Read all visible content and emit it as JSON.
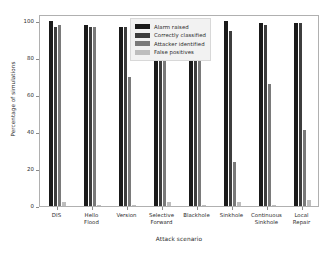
{
  "chart_data": {
    "type": "bar",
    "title": "",
    "xlabel": "Attack scenario",
    "ylabel": "Percentage of simulations",
    "ylim": [
      0,
      104
    ],
    "yticks": [
      0,
      20,
      40,
      60,
      80,
      100
    ],
    "ytick_labels": [
      "0",
      "20",
      "40",
      "60",
      "80",
      "100"
    ],
    "grid": false,
    "legend_position": "upper center",
    "categories": [
      "DIS",
      "Hello\nFlood",
      "Version",
      "Selective\nForward",
      "Blackhole",
      "Sinkhole",
      "Continuous\nSinkhole",
      "Local\nRepair"
    ],
    "series": [
      {
        "name": "Alarm raised",
        "color": "#1a1a1a",
        "values": [
          100,
          98,
          97,
          81,
          81,
          100,
          99,
          99
        ]
      },
      {
        "name": "Correctly classified",
        "color": "#3d3d3d",
        "values": [
          97,
          97,
          97,
          81,
          80,
          95,
          98,
          99
        ]
      },
      {
        "name": "Attacker identified",
        "color": "#7a7a7a",
        "values": [
          98,
          97,
          70,
          81,
          80,
          24,
          66,
          41
        ]
      },
      {
        "name": "False positives",
        "color": "#bdbdbd",
        "values": [
          2,
          0.6,
          0.8,
          2,
          0.6,
          2,
          0.6,
          3
        ]
      }
    ]
  },
  "axes": {
    "frame_color": "#b0b0b0",
    "tick_color": "#8a8a8a",
    "text_color": "#2b2b2b"
  },
  "legend": {
    "background": "#f2f2f2",
    "border": "#d8d8d8"
  }
}
